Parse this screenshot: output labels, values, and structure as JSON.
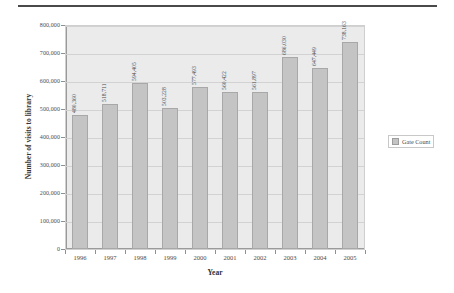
{
  "chart_data": {
    "type": "bar",
    "title": "",
    "xlabel": "Year",
    "ylabel": "Number of visits to library",
    "categories": [
      "1996",
      "1997",
      "1998",
      "1999",
      "2000",
      "2001",
      "2002",
      "2003",
      "2004",
      "2005"
    ],
    "values": [
      480360,
      518711,
      594405,
      503228,
      577493,
      560422,
      561897,
      686030,
      647449,
      738163
    ],
    "data_labels": [
      "480,360",
      "518,711",
      "594,405",
      "503,228",
      "577,493",
      "560,422",
      "561,897",
      "686,030",
      "647,449",
      "738,163"
    ],
    "series": [
      {
        "name": "Gate Count",
        "values": [
          480360,
          518711,
          594405,
          503228,
          577493,
          560422,
          561897,
          686030,
          647449,
          738163
        ]
      }
    ],
    "ylim": [
      0,
      800000
    ],
    "ytick_values": [
      0,
      100000,
      200000,
      300000,
      400000,
      500000,
      600000,
      700000,
      800000
    ],
    "ytick_labels": [
      "0",
      "100,000",
      "200,000",
      "300,000",
      "400,000",
      "500,000",
      "600,000",
      "700,000",
      "800,000"
    ],
    "grid": true,
    "legend_position": "right",
    "legend_entries": [
      "Gate Count"
    ],
    "colors": {
      "bar_fill": "#c4c4c4",
      "bar_border": "#a8a8a8",
      "plot_background": "#ebebeb",
      "gridline": "#d2d2d2",
      "text": "#4b4b4b"
    }
  },
  "legend": {
    "label": "Gate Count"
  }
}
